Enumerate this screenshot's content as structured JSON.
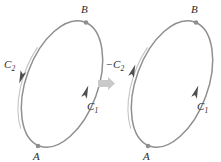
{
  "figure": {
    "colors": {
      "curve": "#8c8c8c",
      "curve_highlight": "#b8b8b8",
      "arrowhead": "#5a5a5a",
      "point_dot": "#8f8f8f",
      "transition_arrow": "#c9c9c9",
      "label_text": "#2b2b2b",
      "background": "#ffffff"
    },
    "panels": [
      {
        "id": "left-panel",
        "name": "original-orientation",
        "ellipse": {
          "center_x": 62,
          "center_y": 84,
          "radius_x": 36,
          "radius_y": 66,
          "rotation_deg": 20
        },
        "points": [
          {
            "id": "B",
            "label": "B",
            "position": "top",
            "x": 86,
            "y": 22,
            "label_x": 79,
            "label_y": 13
          },
          {
            "id": "A",
            "label": "A",
            "position": "bottom",
            "x": 38,
            "y": 146,
            "label_x": 33,
            "label_y": 160
          }
        ],
        "arcs": [
          {
            "id": "C1",
            "label": "C",
            "subscript": "1",
            "sign": "",
            "side": "right",
            "direction": "upward",
            "arrow_x": 84,
            "arrow_y": 92,
            "label_x": 88,
            "label_y": 108
          },
          {
            "id": "C2",
            "label": "C",
            "subscript": "2",
            "sign": "",
            "side": "left",
            "direction": "downward",
            "arrow_x": 21,
            "arrow_y": 77,
            "label_x": 4,
            "label_y": 67
          }
        ]
      },
      {
        "id": "right-panel",
        "name": "reversed-orientation",
        "ellipse": {
          "center_x": 172,
          "center_y": 84,
          "radius_x": 36,
          "radius_y": 66,
          "rotation_deg": 20
        },
        "points": [
          {
            "id": "B",
            "label": "B",
            "position": "top",
            "x": 196,
            "y": 22,
            "label_x": 189,
            "label_y": 13
          },
          {
            "id": "A",
            "label": "A",
            "position": "bottom",
            "x": 148,
            "y": 146,
            "label_x": 143,
            "label_y": 160
          }
        ],
        "arcs": [
          {
            "id": "C1",
            "label": "C",
            "subscript": "1",
            "sign": "",
            "side": "right",
            "direction": "upward",
            "arrow_x": 194,
            "arrow_y": 92,
            "label_x": 198,
            "label_y": 108
          },
          {
            "id": "-C2",
            "label": "C",
            "subscript": "2",
            "sign": "−",
            "side": "left",
            "direction": "upward",
            "arrow_x": 131,
            "arrow_y": 70,
            "label_x": 106,
            "label_y": 67
          }
        ]
      }
    ],
    "transition": {
      "name": "transition-arrow",
      "symbol": "⟶",
      "x": 103,
      "y": 83
    }
  }
}
